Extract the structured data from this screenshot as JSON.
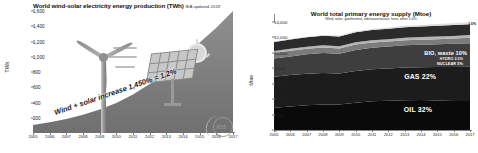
{
  "left": {
    "title": "World wind-solar electricity energy production (TWh)",
    "source": "IEA updated 2019",
    "ylabel": "TWh",
    "annotation": "Wind + solar increase 1,450% = 1.2%",
    "logo": "iea"
  },
  "right": {
    "title": "World total primary energy supply (Mtoe)",
    "subtitle": "Wind, solar, geothermal, tide/wave/ocean, heat, other 1.6%",
    "ylabel": "Mtoe",
    "year_marker": "2017",
    "other_marker": "1.6%"
  },
  "chart_data": [
    {
      "type": "area",
      "title": "World wind-solar electricity energy production (TWh)",
      "subtitle": "IEA updated 2019",
      "xlabel": "",
      "ylabel": "TWh",
      "ylim": [
        0,
        1600
      ],
      "yticks": [
        200,
        400,
        600,
        800,
        1000,
        1200,
        1400,
        1600
      ],
      "ytick_labels": [
        "200",
        "400",
        "600",
        "800",
        "1,000",
        "1,200",
        "1,400",
        "1,600"
      ],
      "grid": false,
      "legend": "none",
      "categories": [
        2005,
        2006,
        2007,
        2008,
        2009,
        2010,
        2011,
        2012,
        2013,
        2014,
        2015,
        2016,
        2017
      ],
      "x_tick_labels": [
        "2005",
        "2006",
        "2007",
        "2008",
        "2009",
        "2010",
        "2011",
        "2012",
        "2013",
        "2014",
        "2015",
        "2016",
        "2017"
      ],
      "series": [
        {
          "name": "Wind + solar electricity production",
          "values": [
            105,
            140,
            185,
            240,
            310,
            400,
            510,
            650,
            810,
            1000,
            1200,
            1400,
            1625
          ]
        }
      ],
      "annotations": [
        "Wind + solar increase 1,450% = 1.2%"
      ]
    },
    {
      "type": "area",
      "stacked": true,
      "title": "World total primary energy supply (Mtoe)",
      "subtitle": "Wind, solar, geothermal, tide/wave/ocean, heat, other 1.6%",
      "xlabel": "",
      "ylabel": "Mtoe",
      "ylim": [
        0,
        14000
      ],
      "yticks": [
        0,
        2000,
        4000,
        6000,
        8000,
        10000,
        12000,
        14000
      ],
      "ytick_labels": [
        "0",
        "2,000",
        "4,000",
        "6,000",
        "8,000",
        "10,000",
        "12,000",
        "14,000"
      ],
      "grid": false,
      "legend": "inline-labels",
      "categories": [
        2005,
        2006,
        2007,
        2008,
        2009,
        2010,
        2011,
        2012,
        2013,
        2014,
        2015,
        2016,
        2017
      ],
      "x_tick_labels": [
        "2005",
        "2006",
        "2007",
        "2008",
        "2009",
        "2010",
        "2011",
        "2012",
        "2013",
        "2014",
        "2015",
        "2016",
        "2017"
      ],
      "series": [
        {
          "name": "COAL 27%",
          "share_pct": 27,
          "color": "#0a0a0a",
          "values": [
            2890,
            3060,
            3200,
            3320,
            3300,
            3530,
            3730,
            3790,
            3870,
            3890,
            3830,
            3760,
            3750
          ]
        },
        {
          "name": "OIL 32%",
          "share_pct": 32,
          "color": "#1c1c1c",
          "values": [
            4020,
            4060,
            4100,
            4080,
            4020,
            4110,
            4140,
            4180,
            4220,
            4260,
            4340,
            4400,
            4450
          ]
        },
        {
          "name": "GAS 22%",
          "share_pct": 22,
          "color": "#3e3e3e",
          "values": [
            2350,
            2420,
            2520,
            2590,
            2560,
            2720,
            2790,
            2850,
            2900,
            2900,
            2940,
            3010,
            3060
          ]
        },
        {
          "name": "NUCLEAR 5%",
          "share_pct": 5,
          "color": "#7b7b7b",
          "values": [
            720,
            730,
            710,
            710,
            700,
            720,
            670,
            640,
            650,
            660,
            670,
            680,
            690
          ]
        },
        {
          "name": "HYDRO 2.5%",
          "share_pct": 2.5,
          "color": "#b5b5b5",
          "values": [
            250,
            260,
            265,
            280,
            285,
            300,
            305,
            315,
            330,
            335,
            340,
            350,
            355
          ]
        },
        {
          "name": "BIO, waste 10%",
          "share_pct": 10,
          "color": "#2b2b2b",
          "values": [
            1180,
            1200,
            1220,
            1250,
            1270,
            1300,
            1320,
            1340,
            1360,
            1380,
            1390,
            1400,
            1410
          ]
        },
        {
          "name": "Wind, solar, geothermal, tide/wave/ocean, heat, other 1.6%",
          "share_pct": 1.6,
          "color": "#dcdcdc",
          "values": [
            60,
            70,
            80,
            95,
            105,
            125,
            145,
            165,
            185,
            200,
            215,
            225,
            235
          ]
        }
      ],
      "annotations": [
        "2017"
      ]
    }
  ]
}
